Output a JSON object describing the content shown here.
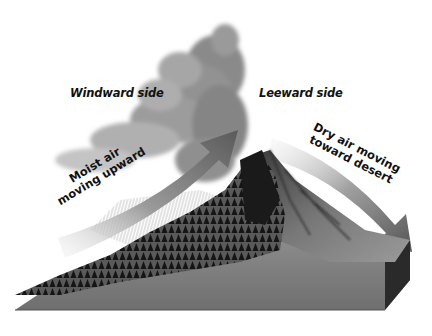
{
  "diagram": {
    "type": "rain-shadow-effect",
    "labels": {
      "windward": "Windward side",
      "leeward": "Leeward side",
      "moist_air_line1": "Moist air",
      "moist_air_line2": "moving upward",
      "dry_air_line1": "Dry air moving",
      "dry_air_line2": "toward desert"
    },
    "elements": [
      {
        "name": "cloud",
        "description": "gray storm cloud over windward slope"
      },
      {
        "name": "mountain",
        "description": "forested windward slope, bare rocky leeward slope"
      },
      {
        "name": "rain",
        "description": "rain streaks falling on windward slope"
      },
      {
        "name": "moist-air-arrow",
        "direction": "up-right"
      },
      {
        "name": "dry-air-arrow",
        "direction": "down-right"
      },
      {
        "name": "ground-block",
        "description": "3D cross-section block of terrain"
      }
    ],
    "colors": {
      "background": "#ffffff",
      "cloud_dark": "#7a7a7a",
      "cloud_light": "#c8c8c8",
      "arrow_dark": "#5a5a5a",
      "arrow_light": "#e6e6e6",
      "forest": "#1e1e1e",
      "rock": "#6a6a6a",
      "ground": "#8a8a8a",
      "block_side": "#2a2a2a",
      "text": "#111111"
    }
  }
}
